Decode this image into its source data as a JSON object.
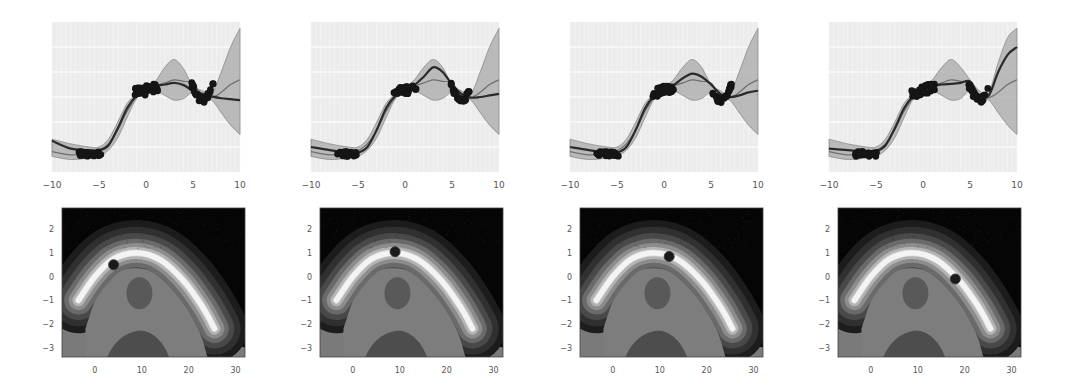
{
  "figure": {
    "layout": "2 rows x 4 columns; top row = 1D Gaussian-process regression, bottom row = 2D contour with query point",
    "colors": {
      "background": "#ffffff",
      "axes_face": "#ececec",
      "grid": "#f7f7f7",
      "band": "#a8a8a8",
      "mean_line": "#2a2a2a",
      "true_line": "#6e6e6e",
      "points": "#151515",
      "tick_text": "#555555"
    }
  },
  "chart_data": [
    {
      "type": "line",
      "panel": "top-1",
      "title": "",
      "xlabel": "",
      "ylabel": "",
      "xlim": [
        -10,
        10
      ],
      "xticks": [
        "-10",
        "-5",
        "0",
        "5",
        "10"
      ],
      "yticks": [],
      "grid": true,
      "series": [
        {
          "name": "posterior_mean",
          "x": [
            -10,
            -8,
            -6,
            -5,
            -4,
            -3,
            -2,
            -1,
            0,
            1,
            2,
            3,
            4,
            5,
            6,
            7,
            8,
            9,
            10
          ],
          "y": [
            -1.0,
            -1.25,
            -1.3,
            -1.3,
            -1.15,
            -0.6,
            0.05,
            0.45,
            0.62,
            0.75,
            0.8,
            0.85,
            0.78,
            0.6,
            0.5,
            0.42,
            0.36,
            0.33,
            0.3
          ]
        },
        {
          "name": "true_function",
          "x": [
            -10,
            -8,
            -6,
            -5,
            -4,
            -3,
            -2,
            -1,
            0,
            1,
            2,
            3,
            4,
            5,
            6,
            7,
            8,
            9,
            10
          ],
          "y": [
            -1.35,
            -1.45,
            -1.4,
            -1.32,
            -1.1,
            -0.65,
            -0.05,
            0.4,
            0.6,
            0.75,
            0.85,
            0.95,
            0.9,
            0.85,
            0.45,
            0.38,
            0.55,
            0.8,
            0.95
          ]
        },
        {
          "name": "upper_band",
          "x": [
            -10,
            -8,
            -6,
            -5,
            -4,
            -3,
            -2,
            -1,
            0,
            1,
            2,
            3,
            4,
            5,
            6,
            7,
            8,
            9,
            10
          ],
          "y": [
            -0.95,
            -1.1,
            -1.2,
            -1.2,
            -0.95,
            -0.4,
            0.2,
            0.5,
            0.7,
            0.9,
            1.35,
            1.6,
            1.3,
            0.75,
            0.6,
            0.5,
            1.2,
            2.0,
            2.6
          ]
        },
        {
          "name": "lower_band",
          "x": [
            -10,
            -8,
            -6,
            -5,
            -4,
            -3,
            -2,
            -1,
            0,
            1,
            2,
            3,
            4,
            5,
            6,
            7,
            8,
            9,
            10
          ],
          "y": [
            -1.5,
            -1.6,
            -1.55,
            -1.5,
            -1.3,
            -0.9,
            -0.25,
            0.35,
            0.55,
            0.6,
            0.45,
            0.3,
            0.35,
            0.55,
            0.35,
            0.3,
            -0.1,
            -0.5,
            -0.8
          ]
        }
      ],
      "observation_clusters": [
        {
          "x_range": [
            -7.2,
            -4.8
          ],
          "y_approx": -1.42
        },
        {
          "x_range": [
            -1.2,
            1.3
          ],
          "y_approx": 0.62
        },
        {
          "x_range": [
            4.8,
            7.2
          ],
          "y_approx": 0.55
        }
      ]
    },
    {
      "type": "line",
      "panel": "top-2",
      "xlim": [
        -10,
        10
      ],
      "xticks": [
        "-10",
        "-5",
        "0",
        "5",
        "10"
      ],
      "yticks": [],
      "grid": true,
      "series": [
        {
          "name": "posterior_mean",
          "x": [
            -10,
            -8,
            -6,
            -5,
            -4,
            -3,
            -2,
            -1,
            0,
            1,
            2,
            3,
            4,
            5,
            6,
            7,
            8,
            9,
            10
          ],
          "y": [
            -1.2,
            -1.3,
            -1.38,
            -1.38,
            -1.2,
            -0.65,
            0.05,
            0.45,
            0.62,
            0.78,
            1.05,
            1.35,
            1.2,
            0.8,
            0.5,
            0.38,
            0.4,
            0.45,
            0.5
          ]
        },
        {
          "name": "true_function",
          "x": [
            -10,
            -8,
            -6,
            -5,
            -4,
            -3,
            -2,
            -1,
            0,
            1,
            2,
            3,
            4,
            5,
            6,
            7,
            8,
            9,
            10
          ],
          "y": [
            -1.35,
            -1.45,
            -1.4,
            -1.32,
            -1.1,
            -0.65,
            -0.05,
            0.4,
            0.6,
            0.75,
            0.85,
            0.95,
            0.9,
            0.85,
            0.45,
            0.38,
            0.55,
            0.8,
            0.95
          ]
        },
        {
          "name": "upper_band",
          "x": [
            -10,
            -8,
            -6,
            -5,
            -4,
            -3,
            -2,
            -1,
            0,
            1,
            2,
            3,
            4,
            5,
            6,
            7,
            8,
            9,
            10
          ],
          "y": [
            -0.95,
            -1.1,
            -1.2,
            -1.2,
            -0.95,
            -0.4,
            0.2,
            0.5,
            0.7,
            0.95,
            1.35,
            1.6,
            1.35,
            0.8,
            0.6,
            0.5,
            1.2,
            2.0,
            2.6
          ]
        },
        {
          "name": "lower_band",
          "x": [
            -10,
            -8,
            -6,
            -5,
            -4,
            -3,
            -2,
            -1,
            0,
            1,
            2,
            3,
            4,
            5,
            6,
            7,
            8,
            9,
            10
          ],
          "y": [
            -1.5,
            -1.6,
            -1.55,
            -1.5,
            -1.3,
            -0.9,
            -0.25,
            0.35,
            0.55,
            0.6,
            0.45,
            0.3,
            0.35,
            0.55,
            0.35,
            0.3,
            -0.1,
            -0.5,
            -0.8
          ]
        }
      ],
      "observation_clusters": [
        {
          "x_range": [
            -7.2,
            -4.8
          ],
          "y_approx": -1.42
        },
        {
          "x_range": [
            -1.2,
            1.3
          ],
          "y_approx": 0.62
        },
        {
          "x_range": [
            4.8,
            7.2
          ],
          "y_approx": 0.55
        }
      ]
    },
    {
      "type": "line",
      "panel": "top-3",
      "xlim": [
        -10,
        10
      ],
      "xticks": [
        "-10",
        "-5",
        "0",
        "5",
        "10"
      ],
      "yticks": [],
      "grid": true,
      "series": [
        {
          "name": "posterior_mean",
          "x": [
            -10,
            -8,
            -6,
            -5,
            -4,
            -3,
            -2,
            -1,
            0,
            1,
            2,
            3,
            4,
            5,
            6,
            7,
            8,
            9,
            10
          ],
          "y": [
            -1.2,
            -1.3,
            -1.38,
            -1.38,
            -1.2,
            -0.65,
            0.05,
            0.45,
            0.62,
            0.78,
            1.0,
            1.15,
            1.05,
            0.8,
            0.5,
            0.4,
            0.45,
            0.55,
            0.6
          ]
        },
        {
          "name": "true_function",
          "x": [
            -10,
            -8,
            -6,
            -5,
            -4,
            -3,
            -2,
            -1,
            0,
            1,
            2,
            3,
            4,
            5,
            6,
            7,
            8,
            9,
            10
          ],
          "y": [
            -1.35,
            -1.45,
            -1.4,
            -1.32,
            -1.1,
            -0.65,
            -0.05,
            0.4,
            0.6,
            0.75,
            0.85,
            0.95,
            0.9,
            0.85,
            0.45,
            0.38,
            0.55,
            0.8,
            0.95
          ]
        },
        {
          "name": "upper_band",
          "x": [
            -10,
            -8,
            -6,
            -5,
            -4,
            -3,
            -2,
            -1,
            0,
            1,
            2,
            3,
            4,
            5,
            6,
            7,
            8,
            9,
            10
          ],
          "y": [
            -0.95,
            -1.1,
            -1.2,
            -1.2,
            -0.95,
            -0.4,
            0.2,
            0.5,
            0.7,
            0.95,
            1.35,
            1.6,
            1.35,
            0.8,
            0.6,
            0.5,
            1.2,
            2.0,
            2.6
          ]
        },
        {
          "name": "lower_band",
          "x": [
            -10,
            -8,
            -6,
            -5,
            -4,
            -3,
            -2,
            -1,
            0,
            1,
            2,
            3,
            4,
            5,
            6,
            7,
            8,
            9,
            10
          ],
          "y": [
            -1.5,
            -1.6,
            -1.55,
            -1.5,
            -1.3,
            -0.9,
            -0.25,
            0.35,
            0.55,
            0.6,
            0.45,
            0.3,
            0.35,
            0.55,
            0.35,
            0.3,
            -0.1,
            -0.5,
            -0.8
          ]
        }
      ],
      "observation_clusters": [
        {
          "x_range": [
            -7.2,
            -4.8
          ],
          "y_approx": -1.42
        },
        {
          "x_range": [
            -1.2,
            1.3
          ],
          "y_approx": 0.62
        },
        {
          "x_range": [
            4.8,
            7.2
          ],
          "y_approx": 0.55
        }
      ]
    },
    {
      "type": "line",
      "panel": "top-4",
      "xlim": [
        -10,
        10
      ],
      "xticks": [
        "-10",
        "-5",
        "0",
        "5",
        "10"
      ],
      "yticks": [],
      "grid": true,
      "series": [
        {
          "name": "posterior_mean",
          "x": [
            -10,
            -8,
            -6,
            -5,
            -4,
            -3,
            -2,
            -1,
            0,
            1,
            2,
            3,
            4,
            5,
            6,
            7,
            8,
            9,
            10
          ],
          "y": [
            -1.25,
            -1.3,
            -1.35,
            -1.33,
            -1.15,
            -0.6,
            0.05,
            0.45,
            0.62,
            0.75,
            0.8,
            0.82,
            0.85,
            0.9,
            0.45,
            0.45,
            1.2,
            1.75,
            2.0
          ]
        },
        {
          "name": "true_function",
          "x": [
            -10,
            -8,
            -6,
            -5,
            -4,
            -3,
            -2,
            -1,
            0,
            1,
            2,
            3,
            4,
            5,
            6,
            7,
            8,
            9,
            10
          ],
          "y": [
            -1.35,
            -1.45,
            -1.4,
            -1.32,
            -1.1,
            -0.65,
            -0.05,
            0.4,
            0.6,
            0.75,
            0.85,
            0.95,
            0.9,
            0.85,
            0.45,
            0.38,
            0.55,
            0.8,
            0.95
          ]
        },
        {
          "name": "upper_band",
          "x": [
            -10,
            -8,
            -6,
            -5,
            -4,
            -3,
            -2,
            -1,
            0,
            1,
            2,
            3,
            4,
            5,
            6,
            7,
            8,
            9,
            10
          ],
          "y": [
            -0.95,
            -1.1,
            -1.2,
            -1.2,
            -0.95,
            -0.4,
            0.2,
            0.5,
            0.7,
            0.95,
            1.35,
            1.6,
            1.35,
            0.95,
            0.6,
            0.55,
            1.5,
            2.3,
            2.6
          ]
        },
        {
          "name": "lower_band",
          "x": [
            -10,
            -8,
            -6,
            -5,
            -4,
            -3,
            -2,
            -1,
            0,
            1,
            2,
            3,
            4,
            5,
            6,
            7,
            8,
            9,
            10
          ],
          "y": [
            -1.5,
            -1.6,
            -1.55,
            -1.5,
            -1.3,
            -0.9,
            -0.25,
            0.35,
            0.55,
            0.6,
            0.45,
            0.3,
            0.35,
            0.6,
            0.35,
            0.3,
            -0.1,
            -0.5,
            -0.8
          ]
        }
      ],
      "observation_clusters": [
        {
          "x_range": [
            -7.2,
            -4.8
          ],
          "y_approx": -1.42
        },
        {
          "x_range": [
            -1.2,
            1.3
          ],
          "y_approx": 0.62
        },
        {
          "x_range": [
            4.8,
            7.2
          ],
          "y_approx": 0.6
        }
      ]
    },
    {
      "type": "heatmap",
      "panel": "bottom-1",
      "subtype": "filled-contour",
      "xlim": [
        -7,
        32
      ],
      "ylim": [
        -3.4,
        2.9
      ],
      "xticks": [
        "0",
        "10",
        "20",
        "30"
      ],
      "yticks": [
        "2",
        "1",
        "0",
        "-1",
        "-2",
        "-3"
      ],
      "ridge_peak": [
        9,
        1.0
      ],
      "query_point": {
        "x": 4,
        "y": 0.5
      }
    },
    {
      "type": "heatmap",
      "panel": "bottom-2",
      "subtype": "filled-contour",
      "xlim": [
        -7,
        32
      ],
      "ylim": [
        -3.4,
        2.9
      ],
      "xticks": [
        "0",
        "10",
        "20",
        "30"
      ],
      "yticks": [
        "2",
        "1",
        "0",
        "-1",
        "-2",
        "-3"
      ],
      "ridge_peak": [
        9,
        1.0
      ],
      "query_point": {
        "x": 9,
        "y": 1.05
      }
    },
    {
      "type": "heatmap",
      "panel": "bottom-3",
      "subtype": "filled-contour",
      "xlim": [
        -7,
        32
      ],
      "ylim": [
        -3.4,
        2.9
      ],
      "xticks": [
        "0",
        "10",
        "20",
        "30"
      ],
      "yticks": [
        "2",
        "1",
        "0",
        "-1",
        "-2",
        "-3"
      ],
      "ridge_peak": [
        9,
        1.0
      ],
      "query_point": {
        "x": 12,
        "y": 0.85
      }
    },
    {
      "type": "heatmap",
      "panel": "bottom-4",
      "subtype": "filled-contour",
      "xlim": [
        -7,
        32
      ],
      "ylim": [
        -3.4,
        2.9
      ],
      "xticks": [
        "0",
        "10",
        "20",
        "30"
      ],
      "yticks": [
        "2",
        "1",
        "0",
        "-1",
        "-2",
        "-3"
      ],
      "ridge_peak": [
        9,
        1.0
      ],
      "query_point": {
        "x": 18,
        "y": -0.1
      }
    }
  ]
}
